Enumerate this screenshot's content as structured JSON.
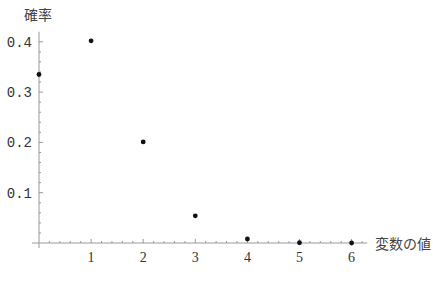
{
  "chart_data": {
    "type": "scatter",
    "title": "",
    "xlabel": "変数の値",
    "ylabel": "確率",
    "x": [
      0,
      1,
      2,
      3,
      4,
      5,
      6
    ],
    "values": [
      0.335,
      0.402,
      0.201,
      0.054,
      0.008,
      0.0005,
      0.0
    ],
    "xlim": [
      0,
      6.3
    ],
    "ylim": [
      0,
      0.42
    ],
    "xticks": [
      "1",
      "2",
      "3",
      "4",
      "5",
      "6"
    ],
    "yticks": [
      "0.1",
      "0.2",
      "0.3",
      "0.4"
    ],
    "grid": false,
    "legend": null,
    "point_color": "#111111",
    "axis_color": "#999999"
  }
}
